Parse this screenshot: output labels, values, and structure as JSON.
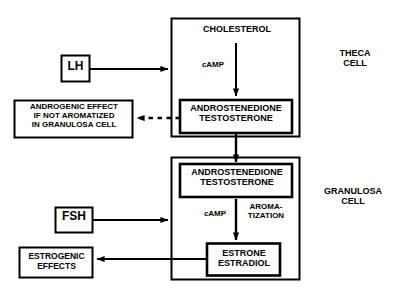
{
  "diagram": {
    "colors": {
      "line": "#000000",
      "background": "#ffffff",
      "text": "#000000"
    },
    "cells": {
      "theca": {
        "label": "THECA\nCELL",
        "substrate": "CHOLESTEROL",
        "mediator": "cAMP",
        "product": "ANDROSTENEDIONE\nTESTOSTERONE"
      },
      "granulosa": {
        "label": "GRANULOSA\nCELL",
        "substrate": "ANDROSTENEDIONE\nTESTOSTERONE",
        "mediator": "cAMP",
        "enzyme_step": "AROMA-\nTIZATION",
        "product": "ESTRONE\nESTRADIOL"
      }
    },
    "hormones": {
      "lh": "LH",
      "fsh": "FSH"
    },
    "outputs": {
      "androgenic": "ANDROGENIC EFFECT\nIF NOT AROMATIZED\nIN GRANULOSA CELL",
      "estrogenic": "ESTROGENIC\nEFFECTS"
    }
  }
}
